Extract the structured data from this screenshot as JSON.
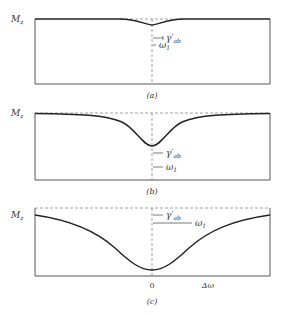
{
  "figure": {
    "y_axis_label": "M",
    "y_axis_subscript": "z",
    "center_tick_label": "0",
    "x_axis_label": "Δω",
    "gamma_label": "γ′",
    "gamma_subscript": "ab",
    "omega_label": "ω",
    "omega_subscript": "1",
    "colors": {
      "frame": "#555555",
      "curve": "#222222",
      "dashed": "#888888",
      "text": "#333333"
    }
  },
  "panels": [
    {
      "id": "a",
      "caption": "(a)",
      "description": "small saturation dip; ω1 << γ'ab"
    },
    {
      "id": "b",
      "caption": "(b)",
      "description": "moderate dip; ω1 ≈ γ'ab"
    },
    {
      "id": "c",
      "caption": "(c)",
      "description": "broad power-broadened dip; ω1 > γ'ab"
    }
  ]
}
